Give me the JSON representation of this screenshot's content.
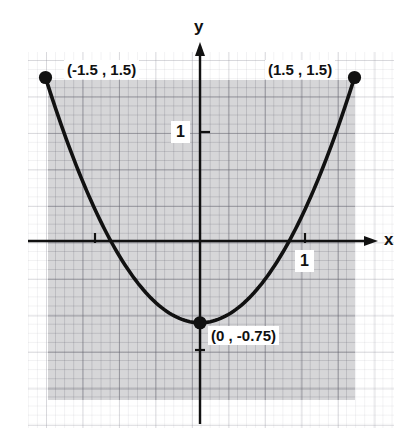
{
  "figure": {
    "background_color": "#ffffff",
    "shade_color": "#9a9aa0",
    "curve_color": "#111111"
  },
  "axes": {
    "x_axis_label": "x",
    "y_axis_label": "y",
    "x_tick_label": "1",
    "y_tick_label": "1"
  },
  "annotations": {
    "left_endpoint": "(-1.5 , 1.5)",
    "right_endpoint": "(1.5 , 1.5)",
    "vertex": "(0 , -0.75)"
  },
  "chart_data": {
    "type": "line",
    "title": "",
    "xlabel": "x",
    "ylabel": "y",
    "xlim": [
      -1.9,
      1.9
    ],
    "ylim": [
      -1.5,
      1.9
    ],
    "grid": true,
    "legend": null,
    "function": "y = x^2 - 0.75",
    "domain": [
      -1.5,
      1.5
    ],
    "x": [
      -1.5,
      -1.25,
      -1.0,
      -0.75,
      -0.5,
      -0.25,
      0,
      0.25,
      0.5,
      0.75,
      1.0,
      1.25,
      1.5
    ],
    "y": [
      1.5,
      0.8125,
      0.25,
      -0.1875,
      -0.5,
      -0.6875,
      -0.75,
      -0.6875,
      -0.5,
      -0.1875,
      0.25,
      0.8125,
      1.5
    ],
    "x_ticks": [
      1
    ],
    "y_ticks": [
      1
    ],
    "points": [
      {
        "label": "(-1.5 , 1.5)",
        "x": -1.5,
        "y": 1.5,
        "marker": "filled-circle"
      },
      {
        "label": "(0 , -0.75)",
        "x": 0,
        "y": -0.75,
        "marker": "filled-circle"
      },
      {
        "label": "(1.5 , 1.5)",
        "x": 1.5,
        "y": 1.5,
        "marker": "filled-circle"
      }
    ],
    "shaded_region": {
      "x_range": [
        -1.5,
        1.5
      ],
      "y_range": [
        -1.47,
        1.47
      ],
      "color": "#9a9aa0"
    }
  }
}
